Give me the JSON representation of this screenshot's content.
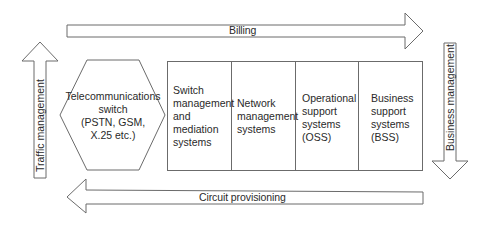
{
  "diagram": {
    "arrows": {
      "top": {
        "label": "Billing",
        "direction": "right"
      },
      "bottom": {
        "label": "Circuit provisioning",
        "direction": "left"
      },
      "left": {
        "label": "Traffic management",
        "direction": "up"
      },
      "right": {
        "label": "Business management",
        "direction": "down"
      }
    },
    "switch": {
      "shape": "hexagon",
      "lines": [
        "Telecommunications",
        "switch",
        "(PSTN, GSM,",
        "X.25 etc.)"
      ]
    },
    "systems": [
      {
        "lines": [
          "Switch",
          "management",
          "and",
          "mediation",
          "systems"
        ]
      },
      {
        "lines": [
          "Network",
          "management",
          "systems"
        ]
      },
      {
        "lines": [
          "Operational",
          "support",
          "systems",
          "(OSS)"
        ]
      },
      {
        "lines": [
          "Business",
          "support",
          "systems",
          "(BSS)"
        ]
      }
    ],
    "colors": {
      "stroke": "#6b6b6b",
      "fill": "#ffffff",
      "text": "#2a2a2a"
    }
  }
}
